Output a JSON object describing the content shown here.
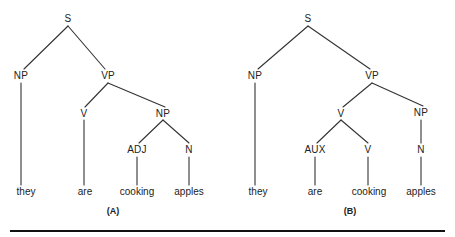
{
  "figure": {
    "background_color": "#ffffff",
    "line_color": "#333333",
    "text_color": "#222222",
    "rule_color": "#111111",
    "type": "syntax-tree-pair",
    "sentence": "they are cooking apples"
  },
  "trees": [
    {
      "id": "tree-a",
      "caption": "(A)",
      "caption_x": 113,
      "caption_y": 211,
      "nodes": [
        {
          "id": "a-s",
          "label": "S",
          "x": 68,
          "y": 19
        },
        {
          "id": "a-np1",
          "label": "NP",
          "x": 21,
          "y": 76
        },
        {
          "id": "a-vp",
          "label": "VP",
          "x": 108,
          "y": 76
        },
        {
          "id": "a-v",
          "label": "V",
          "x": 84,
          "y": 114
        },
        {
          "id": "a-np2",
          "label": "NP",
          "x": 163,
          "y": 114
        },
        {
          "id": "a-adj",
          "label": "ADJ",
          "x": 137,
          "y": 150
        },
        {
          "id": "a-n",
          "label": "N",
          "x": 189,
          "y": 150
        }
      ],
      "words": [
        {
          "id": "a-w1",
          "label": "they",
          "x": 26,
          "y": 192
        },
        {
          "id": "a-w2",
          "label": "are",
          "x": 85,
          "y": 192
        },
        {
          "id": "a-w3",
          "label": "cooking",
          "x": 137,
          "y": 192
        },
        {
          "id": "a-w4",
          "label": "apples",
          "x": 189,
          "y": 192
        }
      ],
      "edges": [
        {
          "x1": 68,
          "y1": 26,
          "x2": 24,
          "y2": 69
        },
        {
          "x1": 68,
          "y1": 26,
          "x2": 105,
          "y2": 69
        },
        {
          "x1": 21,
          "y1": 83,
          "x2": 21,
          "y2": 185
        },
        {
          "x1": 108,
          "y1": 83,
          "x2": 85,
          "y2": 107
        },
        {
          "x1": 108,
          "y1": 83,
          "x2": 165,
          "y2": 107
        },
        {
          "x1": 84,
          "y1": 120,
          "x2": 84,
          "y2": 185
        },
        {
          "x1": 163,
          "y1": 120,
          "x2": 139,
          "y2": 143
        },
        {
          "x1": 163,
          "y1": 120,
          "x2": 189,
          "y2": 143
        },
        {
          "x1": 137,
          "y1": 157,
          "x2": 137,
          "y2": 185
        },
        {
          "x1": 189,
          "y1": 157,
          "x2": 189,
          "y2": 185
        }
      ]
    },
    {
      "id": "tree-b",
      "caption": "(B)",
      "caption_x": 350,
      "caption_y": 211,
      "nodes": [
        {
          "id": "b-s",
          "label": "S",
          "x": 308,
          "y": 19
        },
        {
          "id": "b-np1",
          "label": "NP",
          "x": 255,
          "y": 76
        },
        {
          "id": "b-vp",
          "label": "VP",
          "x": 372,
          "y": 76
        },
        {
          "id": "b-v1",
          "label": "V",
          "x": 341,
          "y": 114
        },
        {
          "id": "b-np2",
          "label": "NP",
          "x": 421,
          "y": 113
        },
        {
          "id": "b-aux",
          "label": "AUX",
          "x": 315,
          "y": 150
        },
        {
          "id": "b-v2",
          "label": "V",
          "x": 368,
          "y": 150
        },
        {
          "id": "b-n",
          "label": "N",
          "x": 421,
          "y": 150
        }
      ],
      "words": [
        {
          "id": "b-w1",
          "label": "they",
          "x": 258,
          "y": 192
        },
        {
          "id": "b-w2",
          "label": "are",
          "x": 315,
          "y": 192
        },
        {
          "id": "b-w3",
          "label": "cooking",
          "x": 369,
          "y": 192
        },
        {
          "id": "b-w4",
          "label": "apples",
          "x": 421,
          "y": 192
        }
      ],
      "edges": [
        {
          "x1": 308,
          "y1": 26,
          "x2": 258,
          "y2": 69
        },
        {
          "x1": 308,
          "y1": 26,
          "x2": 370,
          "y2": 69
        },
        {
          "x1": 255,
          "y1": 83,
          "x2": 255,
          "y2": 185
        },
        {
          "x1": 372,
          "y1": 83,
          "x2": 343,
          "y2": 107
        },
        {
          "x1": 372,
          "y1": 83,
          "x2": 423,
          "y2": 106
        },
        {
          "x1": 341,
          "y1": 120,
          "x2": 317,
          "y2": 143
        },
        {
          "x1": 341,
          "y1": 120,
          "x2": 368,
          "y2": 143
        },
        {
          "x1": 421,
          "y1": 120,
          "x2": 421,
          "y2": 143
        },
        {
          "x1": 315,
          "y1": 157,
          "x2": 315,
          "y2": 185
        },
        {
          "x1": 368,
          "y1": 157,
          "x2": 368,
          "y2": 185
        },
        {
          "x1": 421,
          "y1": 157,
          "x2": 421,
          "y2": 185
        }
      ]
    }
  ],
  "rule": {
    "x": 10,
    "y": 230,
    "width": 435,
    "height": 2
  }
}
